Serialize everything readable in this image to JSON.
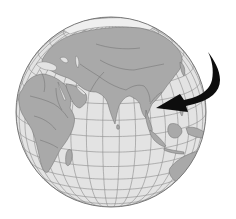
{
  "map": {
    "title": "Globe centered on the Indian Ocean with arrow pointing to Southeast Asia",
    "projection": "orthographic",
    "center": {
      "lon": 75,
      "lat": 15
    },
    "highlighted_region": "Southeast Asia (Vietnam / Laos)",
    "visible_regions": [
      "Europe",
      "Africa",
      "Middle East",
      "Asia",
      "India",
      "Southeast Asia",
      "Indonesia",
      "Australia",
      "Madagascar",
      "Indian Ocean"
    ],
    "colors": {
      "background": "#ffffff",
      "ocean": "#e3e3e3",
      "land": "#a9a9a9",
      "borders": "#6f6f6f",
      "graticule": "#8c8c8c",
      "outline": "#7a7a7a",
      "arrow": "#0d0d0d",
      "ice": "#efefef"
    },
    "arrow": {
      "direction": "curving from upper-right, pointing left",
      "target": "Southeast Asia"
    }
  }
}
